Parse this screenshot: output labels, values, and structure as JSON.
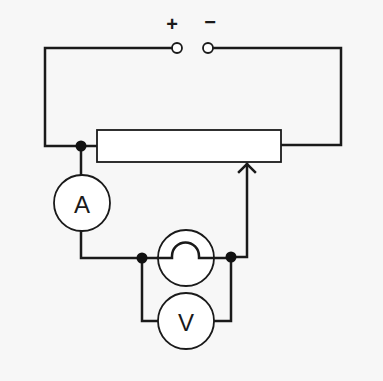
{
  "diagram": {
    "type": "circuit",
    "terminals": {
      "positive_label": "+",
      "negative_label": "−"
    },
    "ammeter": {
      "label": "A"
    },
    "voltmeter": {
      "label": "V"
    },
    "components": [
      "power-supply-terminals",
      "rheostat",
      "ammeter",
      "lamp",
      "voltmeter"
    ],
    "colors": {
      "line": "#1a1a1a",
      "background": "#f7f7f7",
      "fill": "#ffffff"
    }
  }
}
